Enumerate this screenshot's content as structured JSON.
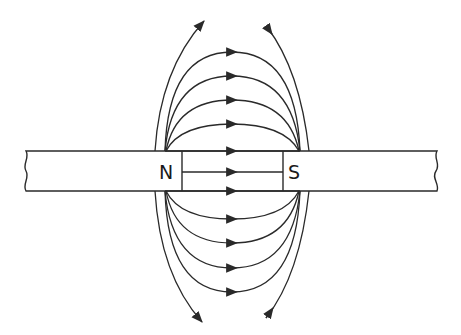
{
  "diagram": {
    "poles": {
      "north_label": "N",
      "south_label": "S"
    },
    "colors": {
      "line": "#2a2a2a",
      "background": "#ffffff"
    },
    "field_lines": {
      "top_arcs": 4,
      "bottom_arcs": 4,
      "straight_lines": 3,
      "outer_lines": 4,
      "direction": "N to S"
    }
  }
}
